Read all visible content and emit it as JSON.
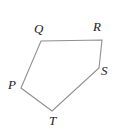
{
  "figure": {
    "type": "polygon-diagram",
    "background_color": "#ffffff",
    "stroke_color": "#8f8f8f",
    "stroke_width": 1.1,
    "label_color": "#1c1c1c",
    "canvas": {
      "width": 119,
      "height": 135
    },
    "shape": {
      "name": "pentagon",
      "closed": true,
      "vertex_order": [
        "P",
        "Q",
        "R",
        "S",
        "T"
      ],
      "path": "M 21 88 L 41 41 L 102 40 L 99 68 L 52 111 Z"
    },
    "vertices": [
      {
        "id": "P",
        "label": "P",
        "x": 21,
        "y": 88,
        "label_x": 8,
        "label_y": 78
      },
      {
        "id": "Q",
        "label": "Q",
        "x": 41,
        "y": 41,
        "label_x": 34,
        "label_y": 22
      },
      {
        "id": "R",
        "label": "R",
        "x": 102,
        "y": 40,
        "label_x": 93,
        "label_y": 20
      },
      {
        "id": "S",
        "label": "S",
        "x": 99,
        "y": 68,
        "label_x": 101,
        "label_y": 64
      },
      {
        "id": "T",
        "label": "T",
        "x": 52,
        "y": 111,
        "label_x": 49,
        "label_y": 114
      }
    ],
    "edges": [
      {
        "from": "P",
        "to": "Q"
      },
      {
        "from": "Q",
        "to": "R"
      },
      {
        "from": "R",
        "to": "S"
      },
      {
        "from": "S",
        "to": "T"
      },
      {
        "from": "T",
        "to": "P"
      }
    ]
  }
}
